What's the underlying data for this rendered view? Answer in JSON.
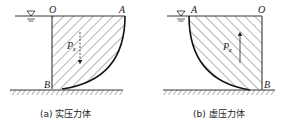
{
  "figures": [
    {
      "id": "a",
      "caption": "(a) 实压力体",
      "labels": {
        "top_left": "O",
        "top_right": "A",
        "bottom": "B",
        "force": "P",
        "force_sub": "z"
      },
      "force_direction": "down"
    },
    {
      "id": "b",
      "caption": "(b) 虚压力体",
      "labels": {
        "top_left": "A",
        "top_right": "O",
        "bottom": "B",
        "force": "P",
        "force_sub": "z"
      },
      "force_direction": "up"
    }
  ],
  "colors": {
    "line": "#222222",
    "hatch": "#444444",
    "background": "#ffffff"
  }
}
